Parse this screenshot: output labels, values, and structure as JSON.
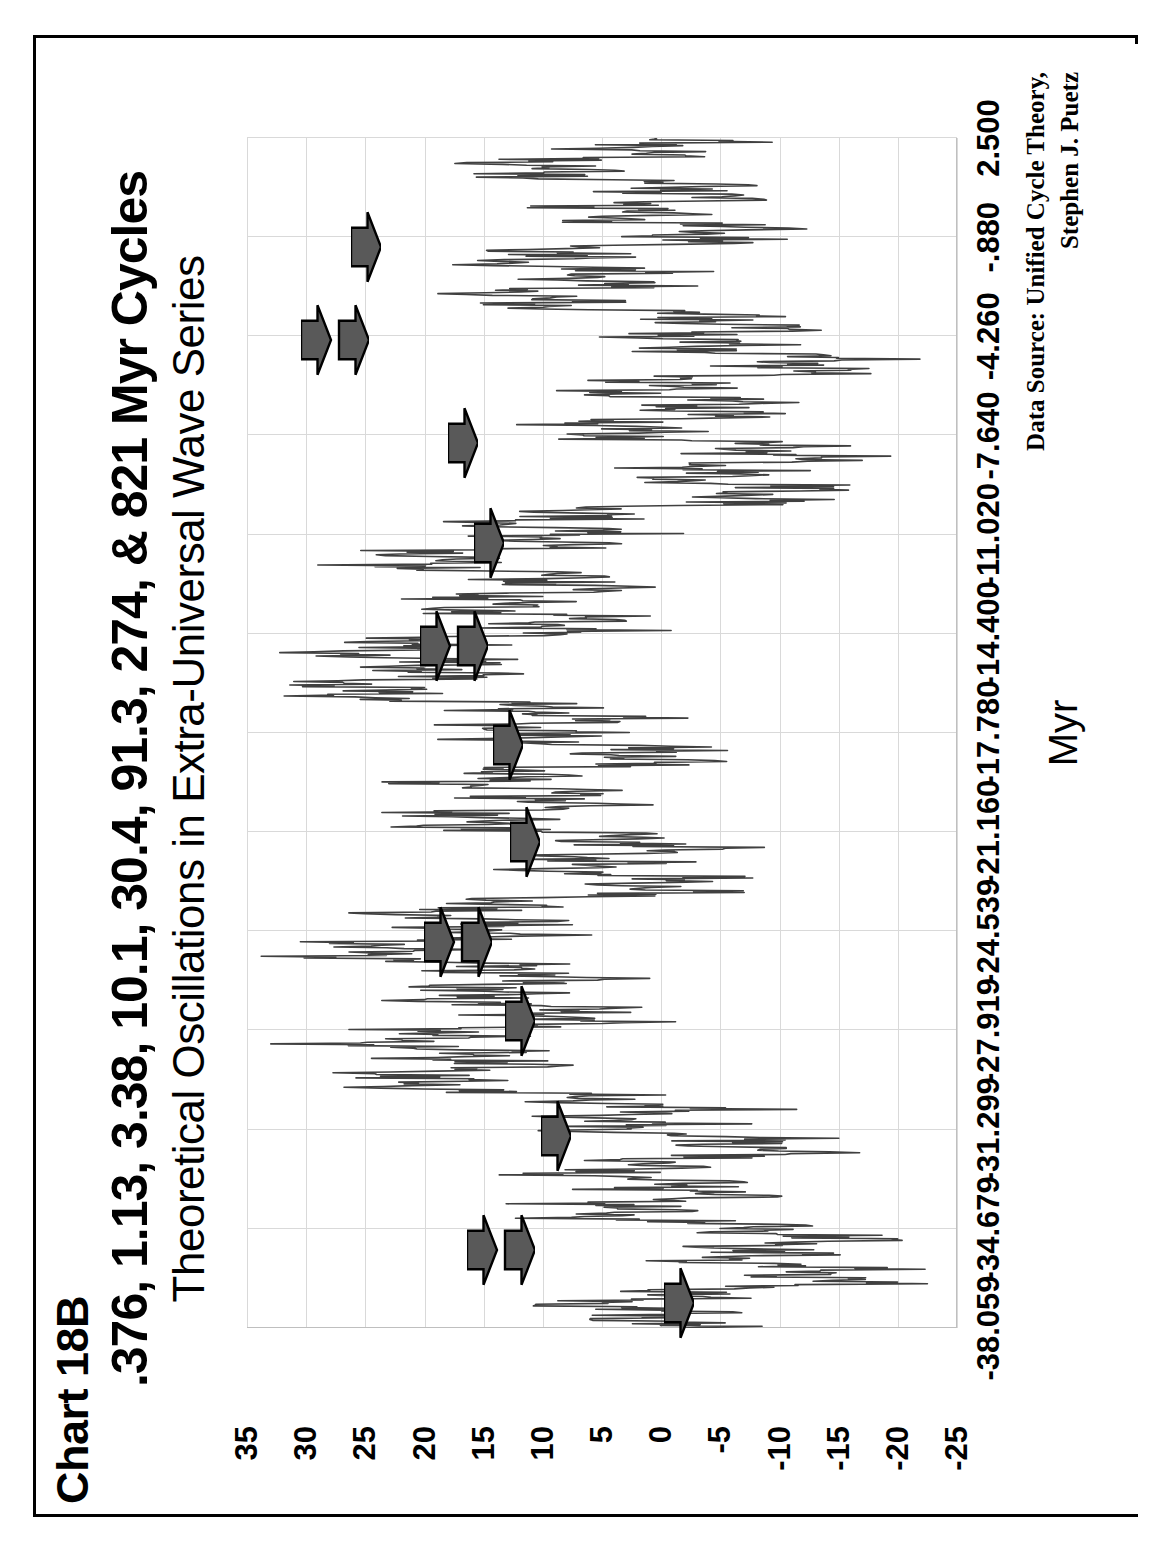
{
  "chart_no": "Chart 18B",
  "title": ".376, 1.13, 3.38, 10.1, 30.4, 91.3, 274, & 821 Myr Cycles",
  "subtitle": "Theoretical Oscillations in Extra-Universal Wave Series",
  "source_line1": "Data Source:  Unified Cycle Theory,",
  "source_line2": "Stephen J. Puetz",
  "colors": {
    "line": "#404040",
    "grid": "#d9d9d9",
    "axis": "#bfbfbf",
    "arrow_fill": "#595959",
    "arrow_stroke": "#000000",
    "frame": "#000000",
    "text": "#000000",
    "background": "#ffffff"
  },
  "chart_data": {
    "type": "line",
    "title": ".376, 1.13, 3.38, 10.1, 30.4, 91.3, 274, & 821 Myr Cycles",
    "subtitle": "Theoretical Oscillations in Extra-Universal Wave Series",
    "xlabel": "Myr",
    "ylabel": "Composite Amplitude",
    "grid": true,
    "legend": "none",
    "orientation": "rotated-90ccw",
    "xlim": [
      -38.059,
      2.5
    ],
    "ylim": [
      -25,
      35
    ],
    "ytick_values": [
      35,
      30,
      25,
      20,
      15,
      10,
      5,
      0,
      -5,
      -10,
      -15,
      -20,
      -25
    ],
    "ytick_labels": [
      "35",
      "30",
      "25",
      "20",
      "15",
      "10",
      "5",
      "0",
      "-5",
      "-10",
      "-15",
      "-20",
      "-25"
    ],
    "xtick_values": [
      -38.059,
      -34.679,
      -31.299,
      -27.919,
      -24.539,
      -21.16,
      -17.78,
      -14.4,
      -11.02,
      -7.64,
      -4.26,
      -0.88,
      2.5
    ],
    "xtick_labels": [
      "-38.059",
      "-34.679",
      "-31.299",
      "-27.919",
      "-24.539",
      "-21.160",
      "-17.780",
      "-14.400",
      "-11.020",
      "-7.640",
      "-4.260",
      "-.880",
      "2.500"
    ],
    "cycle_periods_myr": [
      0.376,
      1.13,
      3.38,
      10.1,
      30.4,
      91.3,
      274,
      821
    ],
    "series": [
      {
        "name": "Composite Amplitude",
        "synthesis": "sum-of-cosines",
        "components": [
          {
            "period": 821,
            "amplitude": 8.0,
            "phase_deg": 186
          },
          {
            "period": 274,
            "amplitude": 7.0,
            "phase_deg": 24
          },
          {
            "period": 91.3,
            "amplitude": 6.0,
            "phase_deg": 201
          },
          {
            "period": 30.4,
            "amplitude": 5.2,
            "phase_deg": 12
          },
          {
            "period": 10.1,
            "amplitude": 4.4,
            "phase_deg": 222
          },
          {
            "period": 3.38,
            "amplitude": 3.4,
            "phase_deg": 36
          },
          {
            "period": 1.13,
            "amplitude": 2.4,
            "phase_deg": 260
          },
          {
            "period": 0.376,
            "amplitude": 1.5,
            "phase_deg": 95
          }
        ],
        "n_points": 1400,
        "observed_min": -22.5,
        "observed_max": 33.8
      }
    ],
    "annotations": [
      {
        "name": "arrow-1",
        "x": -37.2,
        "y": -2.4,
        "count": 1
      },
      {
        "name": "arrow-2",
        "x": -35.4,
        "y": 11.0,
        "count": 2
      },
      {
        "name": "arrow-3",
        "x": -31.5,
        "y": 8.0,
        "count": 1
      },
      {
        "name": "arrow-4",
        "x": -27.6,
        "y": 11.0,
        "count": 1
      },
      {
        "name": "arrow-5",
        "x": -24.9,
        "y": 14.6,
        "count": 2
      },
      {
        "name": "arrow-6",
        "x": -21.5,
        "y": 10.6,
        "count": 1
      },
      {
        "name": "arrow-7",
        "x": -18.2,
        "y": 12.0,
        "count": 1
      },
      {
        "name": "arrow-8",
        "x": -14.8,
        "y": 15.0,
        "count": 2
      },
      {
        "name": "arrow-9",
        "x": -11.3,
        "y": 13.6,
        "count": 1
      },
      {
        "name": "arrow-10",
        "x": -7.9,
        "y": 15.8,
        "count": 1
      },
      {
        "name": "arrow-11",
        "x": -4.4,
        "y": 25.0,
        "count": 2
      },
      {
        "name": "arrow-12",
        "x": -1.2,
        "y": 24.0,
        "count": 1
      }
    ]
  }
}
